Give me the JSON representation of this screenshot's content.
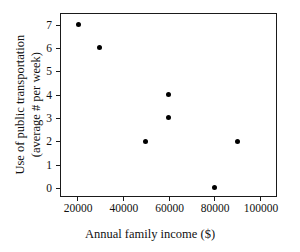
{
  "chart_data": {
    "type": "scatter",
    "title": "",
    "xlabel": "Annual family income ($)",
    "ylabel_line1": "Use of public transportation",
    "ylabel_line2": "(average # per week)",
    "xlim": [
      13000,
      107000
    ],
    "ylim": [
      -0.35,
      7.45
    ],
    "grid": false,
    "legend": "none",
    "marker_color": "#000000",
    "axis_color": "#1a1a1a",
    "background": "#ffffff",
    "xticks": [
      20000,
      40000,
      60000,
      80000,
      100000
    ],
    "xtick_labels": [
      "20000",
      "40000",
      "60000",
      "80000",
      "100000"
    ],
    "yticks": [
      0,
      1,
      2,
      3,
      4,
      5,
      6,
      7
    ],
    "ytick_labels": [
      "0",
      "1",
      "2",
      "3",
      "4",
      "5",
      "6",
      "7"
    ],
    "points": [
      {
        "x": 20500,
        "y": 7
      },
      {
        "x": 30000,
        "y": 6
      },
      {
        "x": 50000,
        "y": 2
      },
      {
        "x": 60000,
        "y": 4
      },
      {
        "x": 60000,
        "y": 3
      },
      {
        "x": 80000,
        "y": 0
      },
      {
        "x": 90000,
        "y": 2
      }
    ]
  }
}
